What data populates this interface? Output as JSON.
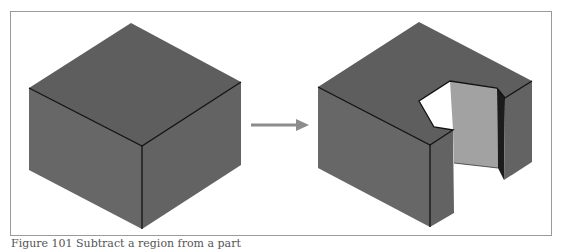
{
  "figure": {
    "caption": "Figure 101 Subtract a region from a part",
    "colors": {
      "top_face": "#5e5e5e",
      "side_face": "#676767",
      "cut_light_face": "#a2a2a2",
      "cut_dark_face": "#1c1c1c",
      "edge": "#111111",
      "arrow": "#8c8c8c",
      "frame": "#9a9a9a"
    },
    "left_shape": {
      "label": "solid-block"
    },
    "arrow": {
      "label": "transform-arrow"
    },
    "right_shape": {
      "label": "block-with-notch-removed"
    }
  }
}
